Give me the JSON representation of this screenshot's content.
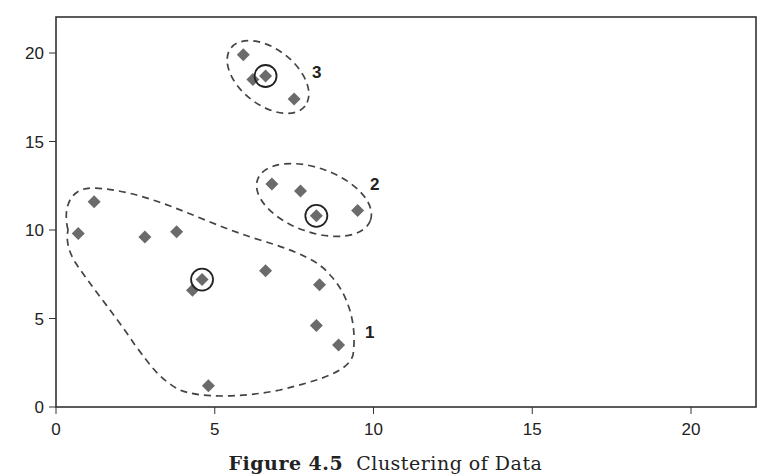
{
  "caption": {
    "prefix": "Figure 4.5",
    "text": "Clustering of Data"
  },
  "colors": {
    "marker": "#6b6b6b",
    "axis": "#333333",
    "dashed": "#444444",
    "circle": "#222222"
  },
  "chart_data": {
    "type": "scatter",
    "title": "Clustering of Data",
    "caption": "Figure 4.5 Clustering of Data",
    "xlabel": "",
    "ylabel": "",
    "xlim": [
      0,
      22
    ],
    "ylim": [
      0,
      22
    ],
    "x_ticks": [
      0,
      5,
      10,
      15,
      20
    ],
    "y_ticks": [
      0,
      5,
      10,
      15,
      20
    ],
    "grid": false,
    "legend": null,
    "marker": "diamond",
    "series": [
      {
        "name": "Cluster 1",
        "label": "1",
        "points": [
          {
            "x": 0.7,
            "y": 9.8
          },
          {
            "x": 1.2,
            "y": 11.6
          },
          {
            "x": 2.8,
            "y": 9.6
          },
          {
            "x": 3.8,
            "y": 9.9
          },
          {
            "x": 4.3,
            "y": 6.6
          },
          {
            "x": 4.6,
            "y": 7.2
          },
          {
            "x": 6.6,
            "y": 7.7
          },
          {
            "x": 8.3,
            "y": 6.9
          },
          {
            "x": 8.2,
            "y": 4.6
          },
          {
            "x": 8.9,
            "y": 3.5
          },
          {
            "x": 4.8,
            "y": 1.2
          }
        ],
        "centroid": {
          "x": 4.6,
          "y": 7.2
        }
      },
      {
        "name": "Cluster 2",
        "label": "2",
        "points": [
          {
            "x": 6.8,
            "y": 12.6
          },
          {
            "x": 7.7,
            "y": 12.2
          },
          {
            "x": 8.2,
            "y": 10.8
          },
          {
            "x": 9.5,
            "y": 11.1
          }
        ],
        "centroid": {
          "x": 8.2,
          "y": 10.8
        }
      },
      {
        "name": "Cluster 3",
        "label": "3",
        "points": [
          {
            "x": 5.9,
            "y": 19.9
          },
          {
            "x": 6.2,
            "y": 18.5
          },
          {
            "x": 6.6,
            "y": 18.7
          },
          {
            "x": 7.5,
            "y": 17.4
          }
        ],
        "centroid": {
          "x": 6.6,
          "y": 18.7
        }
      }
    ],
    "annotations": [
      "Dashed boundaries enclose each cluster",
      "Circled points mark cluster centers"
    ]
  }
}
